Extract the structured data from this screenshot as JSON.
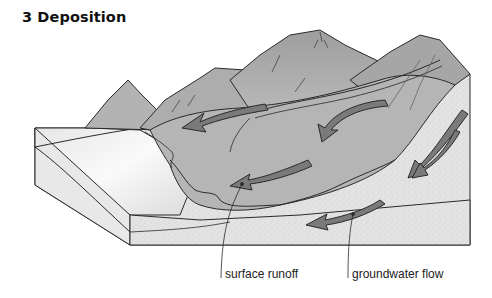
{
  "figure": {
    "title": "3 Deposition",
    "labels": {
      "surface_runoff": "surface runoff",
      "groundwater_flow": "groundwater flow"
    },
    "elements": {
      "mountains": 4,
      "surface_runoff_arrows": 4,
      "groundwater_arrows": 2,
      "sediment_block": "cross-section block with layered deposits"
    },
    "colors": {
      "mountain_fill": "#a9a9a9",
      "mountain_light": "#bdbdbd",
      "arrow_fill": "#7a7a7a",
      "ground_fill": "#e2e2e2",
      "plain_fill": "#f0f0f0",
      "outline": "#2a2a2a"
    }
  }
}
